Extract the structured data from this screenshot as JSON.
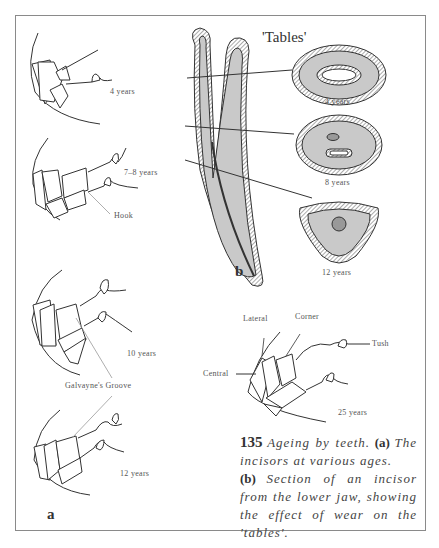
{
  "figure": {
    "number": "135",
    "caption": {
      "lead": "Ageing by teeth.",
      "part_a_marker": "(a)",
      "part_a_text": "The incisors at various ages.",
      "part_b_marker": "(b)",
      "part_b_text": "Section of an incisor from the lower jaw, showing the effect of wear on the 'tables'."
    }
  },
  "panel_a": {
    "letter": "a",
    "ages": [
      "4 years",
      "7–8 years",
      "10 years",
      "12 years",
      "25 years"
    ],
    "labels": {
      "hook": "Hook",
      "galvayne": "Galvayne's Groove",
      "lateral": "Lateral",
      "corner": "Corner",
      "central": "Central",
      "tush": "Tush"
    }
  },
  "panel_b": {
    "letter": "b",
    "title": "'Tables'",
    "sections": [
      "4 years",
      "8 years",
      "12 years"
    ]
  },
  "colors": {
    "ink": "#333333",
    "fill_grey": "#c9c9c9",
    "frame": "#8a8a8a"
  }
}
